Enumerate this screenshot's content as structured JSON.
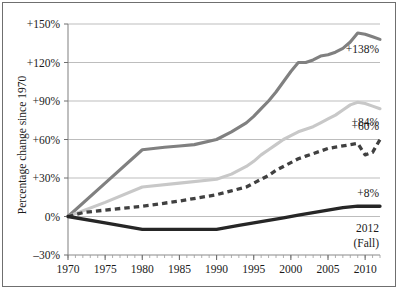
{
  "figure": {
    "border_color": "#6f6f6f",
    "background": "#ffffff"
  },
  "chart_data": {
    "type": "line",
    "title": "",
    "subtitle": "",
    "xlabel": "",
    "ylabel": "Percentage change since 1970",
    "xlim": [
      1970,
      2012
    ],
    "ylim": [
      -30,
      150
    ],
    "ytick_values": [
      150,
      120,
      90,
      60,
      30,
      0,
      -30
    ],
    "ytick_labels": [
      "+150%",
      "+120%",
      "+90%",
      "+60%",
      "+30%",
      "0%",
      "–30%"
    ],
    "xtick_values": [
      1970,
      1975,
      1980,
      1985,
      1990,
      1995,
      2000,
      2005,
      2010
    ],
    "xtick_labels": [
      "1970",
      "1975",
      "1980",
      "1985",
      "1990",
      "1995",
      "2000",
      "2005",
      "2010"
    ],
    "minor_xtick_interval": 1,
    "grid": "horizontal",
    "legend": "none",
    "end_annotation_line1": "2012",
    "end_annotation_line2": "(Fall)",
    "series": [
      {
        "name": "series-dark-gray",
        "style": "solid",
        "color": "#808080",
        "width": 3.1,
        "end_label": "+138%",
        "x": [
          1970,
          1975,
          1980,
          1983,
          1985,
          1987,
          1990,
          1992,
          1994,
          1995,
          1996,
          1997,
          1998,
          1999,
          2000,
          2001,
          2002,
          2003,
          2004,
          2005,
          2006,
          2007,
          2008,
          2009,
          2010,
          2011,
          2012
        ],
        "values": [
          0,
          26,
          52,
          54,
          55,
          56,
          60,
          66,
          73,
          78,
          84,
          90,
          97,
          105,
          113,
          120,
          120,
          122,
          125,
          126,
          128,
          131,
          136,
          143,
          142,
          140,
          138
        ]
      },
      {
        "name": "series-light-gray",
        "style": "solid",
        "color": "#c8c8c8",
        "width": 3.1,
        "end_label": "+84%",
        "x": [
          1970,
          1975,
          1980,
          1985,
          1990,
          1992,
          1994,
          1995,
          1996,
          1997,
          1998,
          1999,
          2000,
          2001,
          2002,
          2003,
          2004,
          2005,
          2006,
          2007,
          2008,
          2009,
          2010,
          2011,
          2012
        ],
        "values": [
          0,
          11,
          23,
          26,
          29,
          33,
          39,
          43,
          48,
          52,
          56,
          60,
          63,
          66,
          68,
          70,
          73,
          76,
          79,
          83,
          87,
          89,
          88,
          86,
          84
        ]
      },
      {
        "name": "series-dashed-dark",
        "style": "dashed",
        "color": "#404040",
        "width": 3.3,
        "end_label": "+60%",
        "x": [
          1970,
          1972,
          1975,
          1980,
          1985,
          1990,
          1992,
          1994,
          1995,
          1996,
          1997,
          1998,
          1999,
          2000,
          2001,
          2002,
          2003,
          2004,
          2005,
          2006,
          2007,
          2008,
          2009,
          2010,
          2011,
          2012
        ],
        "values": [
          0,
          3,
          5,
          8,
          12,
          17,
          20,
          23,
          26,
          29,
          32,
          36,
          39,
          42,
          45,
          47,
          49,
          51,
          53,
          54,
          55,
          56,
          57,
          48,
          50,
          60
        ]
      },
      {
        "name": "series-black-solid",
        "style": "solid",
        "color": "#262626",
        "width": 3.3,
        "end_label": "+8%",
        "x": [
          1970,
          1975,
          1980,
          1985,
          1990,
          1993,
          1995,
          1997,
          1999,
          2001,
          2003,
          2005,
          2007,
          2009,
          2010,
          2011,
          2012
        ],
        "values": [
          0,
          -5,
          -10,
          -10,
          -10,
          -7,
          -5,
          -3,
          -1,
          1,
          3,
          5,
          7,
          8,
          8,
          8,
          8
        ]
      }
    ]
  }
}
